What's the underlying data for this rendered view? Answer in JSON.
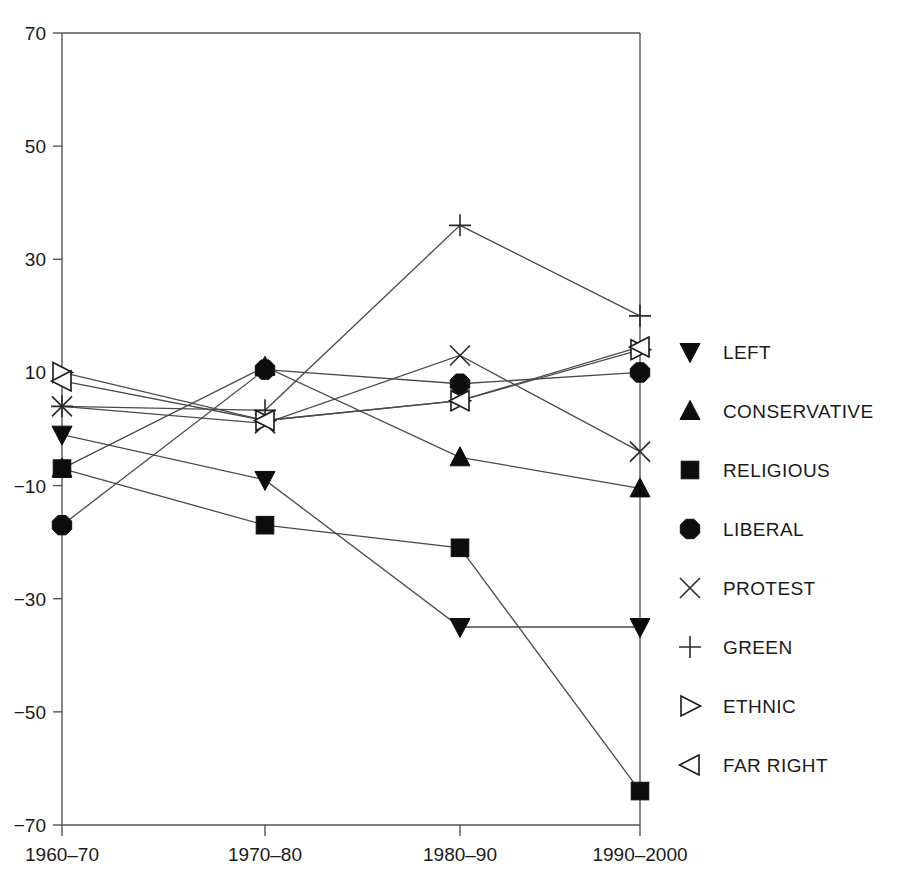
{
  "chart_data": {
    "type": "line",
    "title": "",
    "subtitle": "",
    "xlabel": "",
    "ylabel": "",
    "categories": [
      "1960–70",
      "1970–80",
      "1980–90",
      "1990–2000"
    ],
    "x": [
      "1960–70",
      "1970–80",
      "1980–90",
      "1990–2000"
    ],
    "ylim": [
      -70,
      70
    ],
    "yticks": [
      70,
      50,
      30,
      10,
      -10,
      -30,
      -50,
      -70
    ],
    "ytick_labels": [
      "70",
      "50",
      "30",
      "10",
      "−10",
      "−30",
      "−50",
      "−70"
    ],
    "grid": false,
    "legend_position": "right",
    "series": [
      {
        "name": "LEFT",
        "marker": "triangle-down-filled",
        "values": [
          -1,
          -9,
          -35,
          -35
        ]
      },
      {
        "name": "CONSERVATIVE",
        "marker": "triangle-up-filled",
        "values": [
          -7,
          11,
          -5,
          -10.5
        ]
      },
      {
        "name": "RELIGIOUS",
        "marker": "square-filled",
        "values": [
          -7,
          -17,
          -21,
          -64
        ]
      },
      {
        "name": "LIBERAL",
        "marker": "octagon-filled",
        "values": [
          -17,
          10.5,
          8,
          10
        ]
      },
      {
        "name": "PROTEST",
        "marker": "x-cross",
        "values": [
          4,
          1,
          13,
          -4
        ]
      },
      {
        "name": "GREEN",
        "marker": "plus-cross",
        "values": [
          4,
          3.3,
          36,
          20
        ]
      },
      {
        "name": "ETHNIC",
        "marker": "triangle-right-open",
        "values": [
          10,
          1.5,
          5,
          14
        ]
      },
      {
        "name": "FAR RIGHT",
        "marker": "triangle-left-open",
        "values": [
          8.5,
          1.5,
          5,
          14.5
        ]
      }
    ]
  },
  "legend": {
    "items": [
      {
        "label": "LEFT",
        "marker": "triangle-down-filled"
      },
      {
        "label": "CONSERVATIVE",
        "marker": "triangle-up-filled"
      },
      {
        "label": "RELIGIOUS",
        "marker": "square-filled"
      },
      {
        "label": "LIBERAL",
        "marker": "octagon-filled"
      },
      {
        "label": "PROTEST",
        "marker": "x-cross"
      },
      {
        "label": "GREEN",
        "marker": "plus-cross"
      },
      {
        "label": "ETHNIC",
        "marker": "triangle-right-open"
      },
      {
        "label": "FAR RIGHT",
        "marker": "triangle-left-open"
      }
    ]
  },
  "colors": {
    "background": "#ffffff",
    "axis": "#555555",
    "line": "#4a4a4a",
    "marker_fill": "#0d0d0d",
    "marker_open": "#ffffff",
    "text": "#1a1a1a"
  }
}
